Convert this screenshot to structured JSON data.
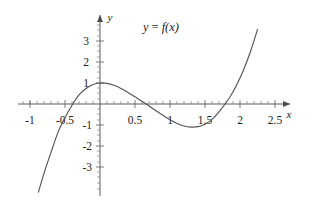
{
  "figure": {
    "title_label": "y = f(x)",
    "equation_parts": {
      "lhs": "y",
      "operator": "=",
      "rhs": "f(x)"
    },
    "background_color": "#ffffff",
    "curve_color": "#555555",
    "axis_color": "#4a4a4a",
    "text_color": "#1d1d1d"
  },
  "axes": {
    "x_axis_name": "x",
    "y_axis_name": "y",
    "x_tick_labels": [
      "-1",
      "-0.5",
      "0.5",
      "1",
      "1.5",
      "2",
      "2.5"
    ],
    "y_tick_labels": [
      "3",
      "2",
      "1",
      "-1",
      "-2",
      "-3"
    ]
  },
  "chart_data": {
    "type": "line",
    "xlabel": "x",
    "ylabel": "y",
    "xlim": [
      -1.15,
      2.7
    ],
    "ylim": [
      -4.3,
      3.9
    ],
    "xticks": [
      -1,
      -0.5,
      0.5,
      1,
      1.5,
      2,
      2.5
    ],
    "xtick_labels": [
      "-1",
      "-0.5",
      "0.5",
      "1",
      "1.5",
      "2",
      "2.5"
    ],
    "yticks": [
      3,
      2,
      1,
      -1,
      -2,
      -3
    ],
    "ytick_labels": [
      "3",
      "2",
      "1",
      "-1",
      "-2",
      "-3"
    ],
    "grid": false,
    "legend": "none",
    "annotations": [
      {
        "text": "y = f(x)",
        "x": 0.62,
        "y": 3.45
      }
    ],
    "series": [
      {
        "name": "f(x)",
        "description": "cubic curve with roots at approximately -0.52, 0.66 and 1.85",
        "roots": [
          -0.52,
          0.66,
          1.85
        ],
        "local_maximum": {
          "x": 0.0,
          "y": 1.0
        },
        "local_minimum": {
          "x": 1.3,
          "y": -1.1
        },
        "y_intercept": 1.0,
        "x": [
          -0.88,
          -0.8,
          -0.7,
          -0.6,
          -0.52,
          -0.4,
          -0.3,
          -0.2,
          -0.1,
          0.0,
          0.1,
          0.2,
          0.3,
          0.4,
          0.5,
          0.66,
          0.8,
          0.9,
          1.0,
          1.1,
          1.2,
          1.3,
          1.4,
          1.5,
          1.6,
          1.7,
          1.85,
          1.95,
          2.05,
          2.15,
          2.25
        ],
        "values": [
          -4.2,
          -3.3,
          -2.3,
          -1.35,
          -0.78,
          -0.06,
          0.43,
          0.74,
          0.93,
          1.0,
          0.98,
          0.89,
          0.74,
          0.55,
          0.34,
          0.0,
          -0.32,
          -0.54,
          -0.75,
          -0.93,
          -1.05,
          -1.1,
          -1.08,
          -0.96,
          -0.73,
          -0.37,
          0.3,
          0.89,
          1.62,
          2.5,
          3.55
        ]
      }
    ]
  }
}
